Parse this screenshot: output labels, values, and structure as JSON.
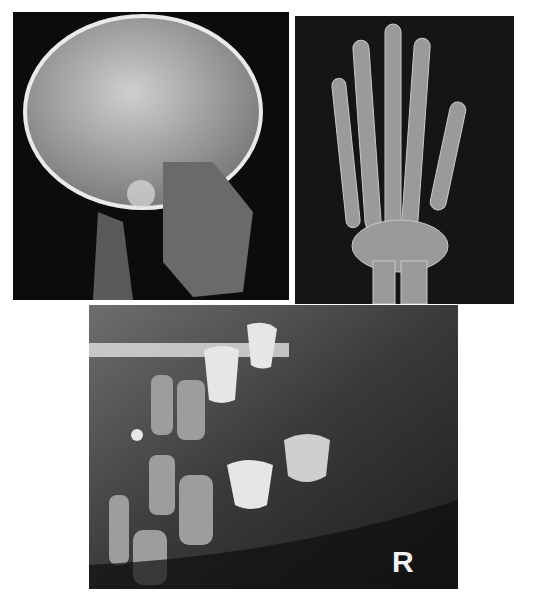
{
  "figure": {
    "panels": [
      {
        "id": "skull",
        "description": "Lateral skull radiograph"
      },
      {
        "id": "hand",
        "description": "Hand and wrist radiograph"
      },
      {
        "id": "jaw",
        "description": "Dental/mandible radiograph"
      }
    ],
    "marker_label": "R"
  }
}
